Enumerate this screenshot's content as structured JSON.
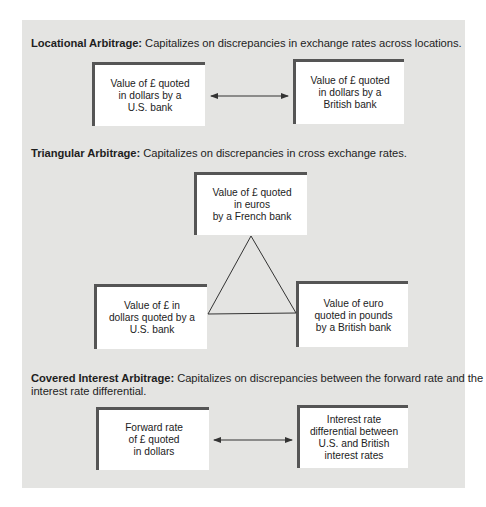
{
  "colors": {
    "panel_bg": "#e4e4e2",
    "box_bg": "#ffffff",
    "box_border": "#555555",
    "text": "#222222",
    "line": "#333333"
  },
  "sections": [
    {
      "title": "Locational Arbitrage:",
      "description": "Capitalizes on discrepancies in exchange rates across locations.",
      "boxes": [
        {
          "text": "Value of £ quoted\nin dollars by a\nU.S. bank"
        },
        {
          "text": "Value of £ quoted\nin dollars by a\nBritish bank"
        }
      ],
      "connector": "double-arrow"
    },
    {
      "title": "Triangular Arbitrage:",
      "description": "Capitalizes on discrepancies in cross exchange rates.",
      "boxes": [
        {
          "text": "Value of £ quoted\nin euros\nby a French bank"
        },
        {
          "text": "Value of £ in\ndollars quoted by a\nU.S. bank"
        },
        {
          "text": "Value of euro\nquoted in pounds\nby a British bank"
        }
      ],
      "connector": "triangle"
    },
    {
      "title": "Covered Interest Arbitrage:",
      "description": "Capitalizes on discrepancies between the forward rate and the",
      "description_line2": "interest rate differential.",
      "boxes": [
        {
          "text": "Forward rate\nof £ quoted\nin dollars"
        },
        {
          "text": "Interest rate\ndifferential between\nU.S. and British\ninterest rates"
        }
      ],
      "connector": "double-arrow"
    }
  ]
}
